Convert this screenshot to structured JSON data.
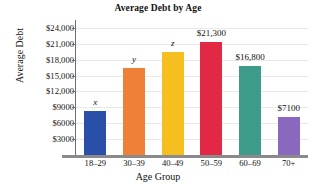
{
  "chart_data": {
    "type": "bar",
    "title": "Average Debt by Age",
    "xlabel": "Age Group",
    "ylabel": "Average Debt",
    "categories": [
      "18–29",
      "30–39",
      "40–49",
      "50–59",
      "60–69",
      "70+"
    ],
    "values": [
      8300,
      16400,
      19500,
      21300,
      16800,
      7100
    ],
    "data_labels": [
      "x",
      "y",
      "z",
      "$21,300",
      "$16,800",
      "$7100"
    ],
    "label_is_variable": [
      true,
      true,
      true,
      false,
      false,
      false
    ],
    "colors": [
      "#2a4fa8",
      "#ef8038",
      "#f5c01f",
      "#e32846",
      "#3d9b8a",
      "#8a68bd"
    ],
    "ylim": [
      0,
      25500
    ],
    "ytick_values": [
      3000,
      6000,
      9000,
      12000,
      15000,
      18000,
      21000,
      24000
    ],
    "ytick_labels": [
      "$3000",
      "$6000",
      "$9000",
      "$12,000",
      "$15,000",
      "$18,000",
      "$21,000",
      "$24,000"
    ],
    "grid": true,
    "legend": "none",
    "axis_color": "#6f6f72",
    "grid_color": "#e9e9ec",
    "baseline_color": "#8a8a8d"
  }
}
